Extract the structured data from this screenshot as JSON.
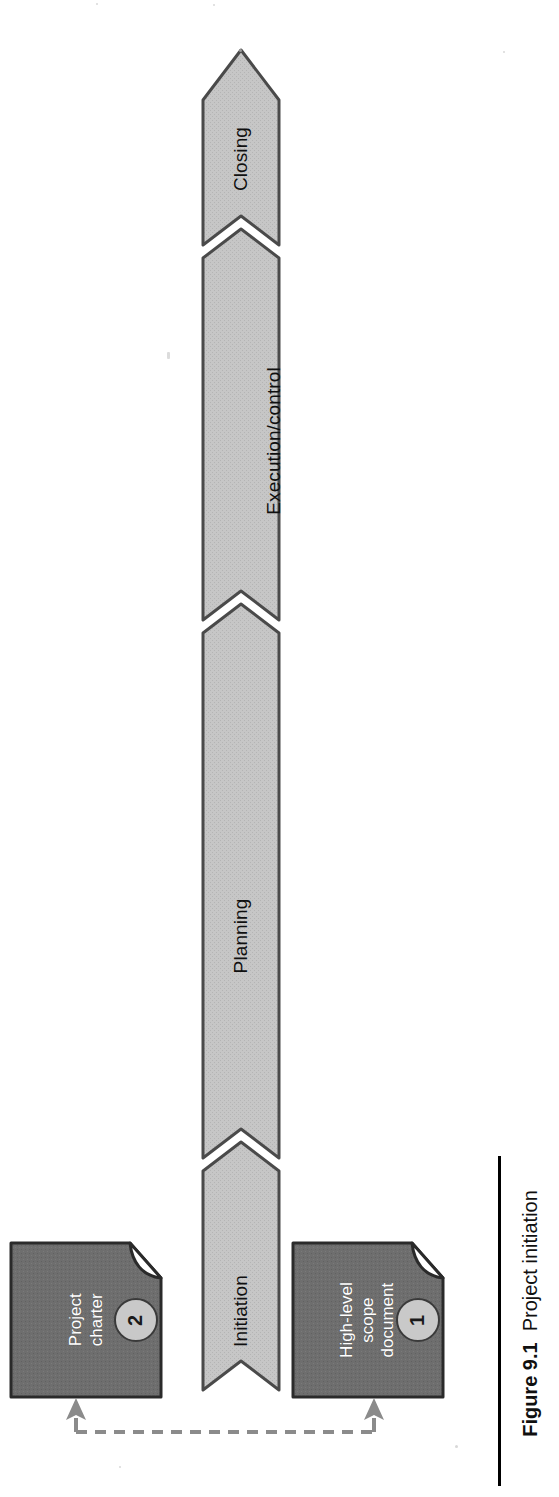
{
  "figure": {
    "caption_number": "Figure 9.1",
    "caption_title": "Project initiation",
    "orientation": "rotated-90-ccw",
    "page_background": "#ffffff"
  },
  "colors": {
    "arrow_fill": "#c3c3c3",
    "arrow_stroke": "#4a4a4a",
    "document_fill": "#6e6e6e",
    "document_stroke": "#2a2a2a",
    "document_fold": "#8a8a8a",
    "badge_fill": "#c9c9c9",
    "badge_stroke": "#3a3a3a",
    "label_on_arrow": "#101010",
    "label_on_document": "#ffffff",
    "connector": "#8b8b8b",
    "caption_rule": "#000000"
  },
  "process_arrow": {
    "name": "project-life-cycle-arrow",
    "direction": "bottom-to-top",
    "segments": [
      {
        "id": "closing",
        "label": "Closing"
      },
      {
        "id": "execution",
        "label": "Execution/control"
      },
      {
        "id": "planning",
        "label": "Planning"
      },
      {
        "id": "initiation",
        "label": "Initiation"
      }
    ]
  },
  "documents": [
    {
      "id": "project-charter",
      "label_lines": "Project\ncharter",
      "label": "Project charter",
      "badge": "2"
    },
    {
      "id": "high-level-scope-document",
      "label_lines": "High-level\nscope\ndocument",
      "label": "High-level scope document",
      "badge": "1"
    }
  ],
  "connector": {
    "id": "document-link",
    "style": "dashed",
    "arrowheads": "both-ends",
    "label": ""
  }
}
